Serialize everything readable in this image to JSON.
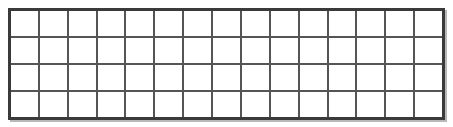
{
  "image": {
    "title": "Wire mesh grid panel",
    "width": 453,
    "height": 127,
    "background_color": "#ffffff"
  },
  "panel": {
    "name": "wire-mesh-panel",
    "x": 8,
    "y": 8,
    "width": 437,
    "height": 112,
    "columns": 15,
    "rows": 4,
    "cell_width": 29.13,
    "cell_height": 28.0,
    "frame_color": "#3a3a3a",
    "wire_color": "#555555",
    "wire_thickness": 2,
    "frame_thickness": 3,
    "cell_fill": "#ffffff",
    "shadow_color": "#b8b8b8"
  },
  "cells": [
    [
      1,
      2,
      3,
      4,
      5,
      6,
      7,
      8,
      9,
      10,
      11,
      12,
      13,
      14,
      15
    ],
    [
      16,
      17,
      18,
      19,
      20,
      21,
      22,
      23,
      24,
      25,
      26,
      27,
      28,
      29,
      30
    ],
    [
      31,
      32,
      33,
      34,
      35,
      36,
      37,
      38,
      39,
      40,
      41,
      42,
      43,
      44,
      45
    ],
    [
      46,
      47,
      48,
      49,
      50,
      51,
      52,
      53,
      54,
      55,
      56,
      57,
      58,
      59,
      60
    ]
  ]
}
